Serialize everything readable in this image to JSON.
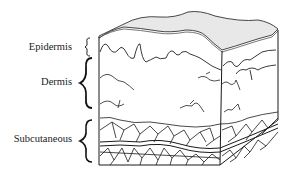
{
  "figure": {
    "type": "skin-cross-section",
    "layers": [
      {
        "name": "Epidermis",
        "label": "Epidermis"
      },
      {
        "name": "Dermis",
        "label": "Dermis"
      },
      {
        "name": "Subcutaneous",
        "label": "Subcutaneous"
      }
    ],
    "colors": {
      "surface_fill": "#e8e8e8",
      "line": "#1a1a1a",
      "text": "#222222",
      "background": "#ffffff"
    }
  }
}
